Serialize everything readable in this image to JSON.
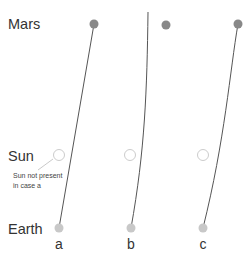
{
  "diagram": {
    "rows": {
      "mars": "Mars",
      "sun": "Sun",
      "earth": "Earth"
    },
    "cases": [
      {
        "label": "a",
        "sun_present": false
      },
      {
        "label": "b",
        "sun_present": true
      },
      {
        "label": "c",
        "sun_present": true
      }
    ],
    "annotation": {
      "line1": "Sun not present",
      "line2": "in case a"
    },
    "colors": {
      "mars": "#888888",
      "sun_stroke": "#cccccc",
      "earth": "#c8c8c8",
      "path": "#555555",
      "text": "#333333"
    }
  }
}
